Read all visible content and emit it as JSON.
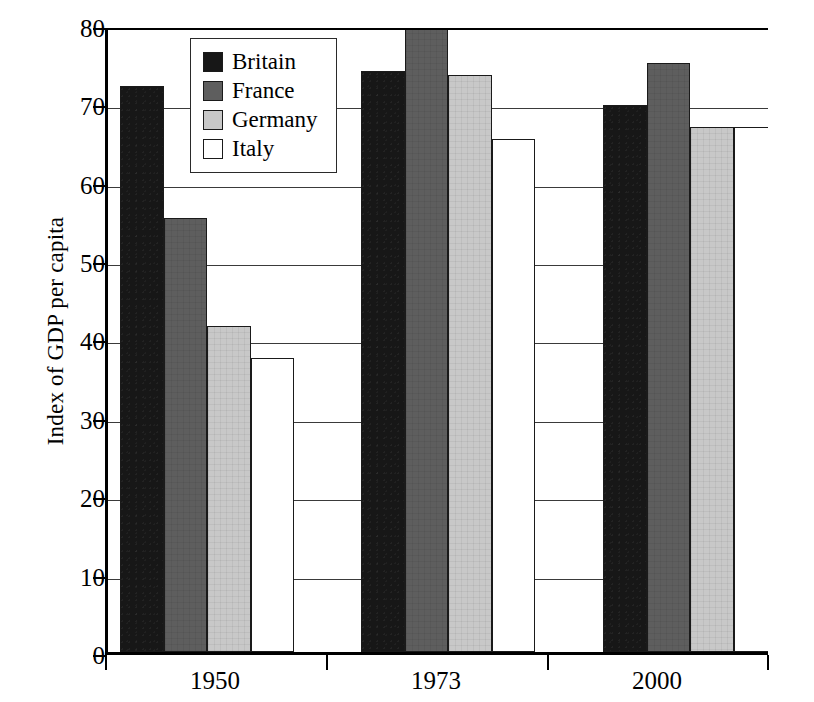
{
  "chart_data": {
    "type": "bar",
    "title": "",
    "subtitle": "",
    "xlabel": "",
    "ylabel": "Index of GDP per capita",
    "categories": [
      "1950",
      "1973",
      "2000"
    ],
    "series": [
      {
        "name": "Britain",
        "color": "#171717",
        "values": [
          72.2,
          74.1,
          69.8
        ]
      },
      {
        "name": "France",
        "color": "#5e5e5e",
        "values": [
          55.4,
          80.5,
          75.1
        ]
      },
      {
        "name": "Germany",
        "color": "#c8c8c8",
        "values": [
          41.6,
          73.6,
          67.0
        ]
      },
      {
        "name": "Italy",
        "color": "#ffffff",
        "values": [
          37.5,
          65.5,
          67.0
        ]
      }
    ],
    "ylim": [
      0,
      80
    ],
    "ytick_labels": [
      "0",
      "10",
      "20",
      "30",
      "40",
      "50",
      "60",
      "70",
      "80"
    ],
    "ytick_values": [
      0,
      10,
      20,
      30,
      40,
      50,
      60,
      70,
      80
    ],
    "grid": true,
    "grid_axis": "y",
    "legend_position": "top-left-inside"
  },
  "legend": {
    "entries": [
      {
        "label": "Britain",
        "swatch": "legend-swatch-britain"
      },
      {
        "label": "France",
        "swatch": "legend-swatch-france"
      },
      {
        "label": "Germany",
        "swatch": "legend-swatch-germany"
      },
      {
        "label": "Italy",
        "swatch": "legend-swatch-italy"
      }
    ]
  },
  "axes": {
    "y_title": "Index of GDP per capita",
    "y_ticks": [
      "80",
      "70",
      "60",
      "50",
      "40",
      "30",
      "20",
      "10",
      "0"
    ],
    "x_ticks": [
      "1950",
      "1973",
      "2000"
    ]
  }
}
